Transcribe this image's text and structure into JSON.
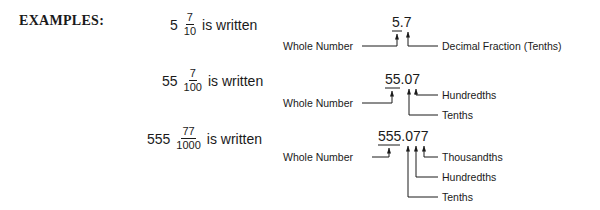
{
  "heading": "EXAMPLES:",
  "examples": [
    {
      "whole": "5",
      "numerator": "7",
      "denominator": "10",
      "suffix": "is written",
      "decimal": "5.7",
      "labels": {
        "whole": "Whole Number",
        "digits": [
          "Decimal Fraction (Tenths)"
        ]
      }
    },
    {
      "whole": "55",
      "numerator": "7",
      "denominator": "100",
      "suffix": "is written",
      "decimal": "55.07",
      "labels": {
        "whole": "Whole Number",
        "digits": [
          "Hundredths",
          "Tenths"
        ]
      }
    },
    {
      "whole": "555",
      "numerator": "77",
      "denominator": "1000",
      "suffix": "is written",
      "decimal": "555.077",
      "labels": {
        "whole": "Whole Number",
        "digits": [
          "Thousandths",
          "Hundredths",
          "Tenths"
        ]
      }
    }
  ]
}
